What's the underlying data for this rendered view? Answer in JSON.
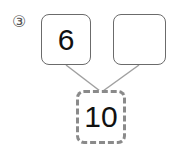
{
  "problem": {
    "label": "③",
    "parts": [
      {
        "position": "top-left",
        "value": "6"
      },
      {
        "position": "top-right",
        "value": ""
      }
    ],
    "whole": {
      "position": "bottom",
      "value": "10",
      "style": "dashed"
    }
  },
  "colors": {
    "solid_border": "#6b6b6b",
    "dashed_border": "#8a8a8a",
    "connector": "#a0a0a0",
    "text": "#111111"
  }
}
